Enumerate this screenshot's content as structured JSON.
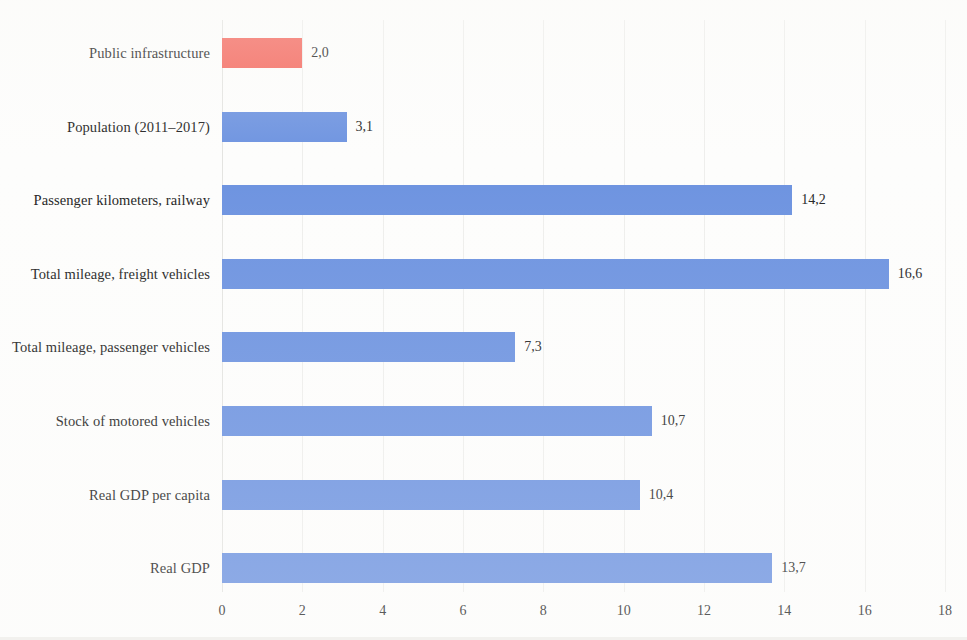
{
  "chart_data": {
    "type": "bar",
    "orientation": "horizontal",
    "title": "",
    "subtitle": "",
    "xlabel": "",
    "ylabel": "",
    "xlim": [
      0,
      18
    ],
    "xticks": [
      "0",
      "2",
      "4",
      "6",
      "8",
      "10",
      "12",
      "14",
      "16",
      "18"
    ],
    "xtick_values": [
      0,
      2,
      4,
      6,
      8,
      10,
      12,
      14,
      16,
      18
    ],
    "grid": true,
    "legend": "none",
    "decimal_separator": ",",
    "categories": [
      "Public infrastructure",
      "Population (2011–2017)",
      "Passenger kilometers, railway",
      "Total mileage, freight vehicles",
      "Total mileage, passenger vehicles",
      "Stock of motored vehicles",
      "Real GDP per capita",
      "Real GDP"
    ],
    "values": [
      2.0,
      3.1,
      14.2,
      16.6,
      7.3,
      10.7,
      10.4,
      13.7
    ],
    "value_labels": [
      "2,0",
      "3,1",
      "14,2",
      "16,6",
      "7,3",
      "10,7",
      "10,4",
      "13,7"
    ],
    "bar_colors": [
      "#f4685e",
      "#6d93e0",
      "#6d93e0",
      "#6d93e0",
      "#6d93e0",
      "#6d93e0",
      "#6d93e0",
      "#6d93e0"
    ],
    "colors": {
      "highlight": "#f4685e",
      "series": "#6d93e0",
      "gridline": "#eeeeec",
      "background": "#fdfdfc",
      "text": "#232323"
    }
  }
}
